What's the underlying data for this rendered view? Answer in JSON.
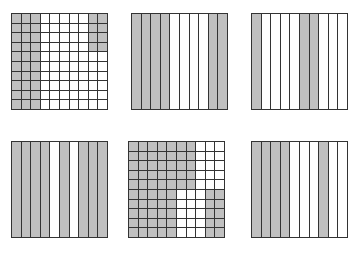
{
  "colors": {
    "shaded": "#c0c0c0",
    "unshaded": "#ffffff",
    "line": "#333333"
  },
  "figures": [
    {
      "id": "grid-1",
      "type": "hundred-grid",
      "position": {
        "left": 11,
        "top": 13
      },
      "shaded_cells": "columns 0-2 all rows; columns 8-9 rows 0-3",
      "rows": [
        [
          1,
          1,
          1,
          0,
          0,
          0,
          0,
          0,
          1,
          1
        ],
        [
          1,
          1,
          1,
          0,
          0,
          0,
          0,
          0,
          1,
          1
        ],
        [
          1,
          1,
          1,
          0,
          0,
          0,
          0,
          0,
          1,
          1
        ],
        [
          1,
          1,
          1,
          0,
          0,
          0,
          0,
          0,
          1,
          1
        ],
        [
          1,
          1,
          1,
          0,
          0,
          0,
          0,
          0,
          0,
          0
        ],
        [
          1,
          1,
          1,
          0,
          0,
          0,
          0,
          0,
          0,
          0
        ],
        [
          1,
          1,
          1,
          0,
          0,
          0,
          0,
          0,
          0,
          0
        ],
        [
          1,
          1,
          1,
          0,
          0,
          0,
          0,
          0,
          0,
          0
        ],
        [
          1,
          1,
          1,
          0,
          0,
          0,
          0,
          0,
          0,
          0
        ],
        [
          1,
          1,
          1,
          0,
          0,
          0,
          0,
          0,
          0,
          0
        ]
      ]
    },
    {
      "id": "grid-2",
      "type": "tenths-strips",
      "position": {
        "left": 131,
        "top": 13
      },
      "columns": [
        1,
        1,
        1,
        1,
        0,
        0,
        0,
        0,
        1,
        1
      ]
    },
    {
      "id": "grid-3",
      "type": "tenths-strips",
      "position": {
        "left": 251,
        "top": 13
      },
      "columns": [
        1,
        0,
        0,
        0,
        0,
        1,
        1,
        0,
        0,
        0
      ]
    },
    {
      "id": "grid-4",
      "type": "tenths-strips",
      "position": {
        "left": 11,
        "top": 141
      },
      "columns": [
        1,
        1,
        1,
        1,
        0,
        1,
        0,
        1,
        1,
        1
      ]
    },
    {
      "id": "grid-5",
      "type": "hundred-grid",
      "position": {
        "left": 128,
        "top": 141
      },
      "rows": [
        [
          1,
          1,
          1,
          1,
          1,
          1,
          1,
          0,
          0,
          0
        ],
        [
          1,
          1,
          1,
          1,
          1,
          1,
          1,
          0,
          0,
          0
        ],
        [
          1,
          1,
          1,
          1,
          1,
          1,
          1,
          0,
          0,
          0
        ],
        [
          1,
          1,
          1,
          1,
          1,
          1,
          1,
          0,
          0,
          0
        ],
        [
          1,
          1,
          1,
          1,
          1,
          1,
          1,
          0,
          0,
          0
        ],
        [
          1,
          1,
          1,
          1,
          1,
          0,
          0,
          0,
          1,
          1
        ],
        [
          1,
          1,
          1,
          1,
          1,
          0,
          0,
          0,
          1,
          1
        ],
        [
          1,
          1,
          1,
          1,
          1,
          0,
          0,
          0,
          1,
          1
        ],
        [
          1,
          1,
          1,
          1,
          1,
          0,
          0,
          0,
          1,
          1
        ],
        [
          1,
          1,
          1,
          1,
          1,
          0,
          0,
          0,
          1,
          1
        ]
      ]
    },
    {
      "id": "grid-6",
      "type": "tenths-strips",
      "position": {
        "left": 251,
        "top": 141
      },
      "columns": [
        1,
        1,
        1,
        1,
        0,
        0,
        0,
        1,
        0,
        0
      ]
    }
  ]
}
